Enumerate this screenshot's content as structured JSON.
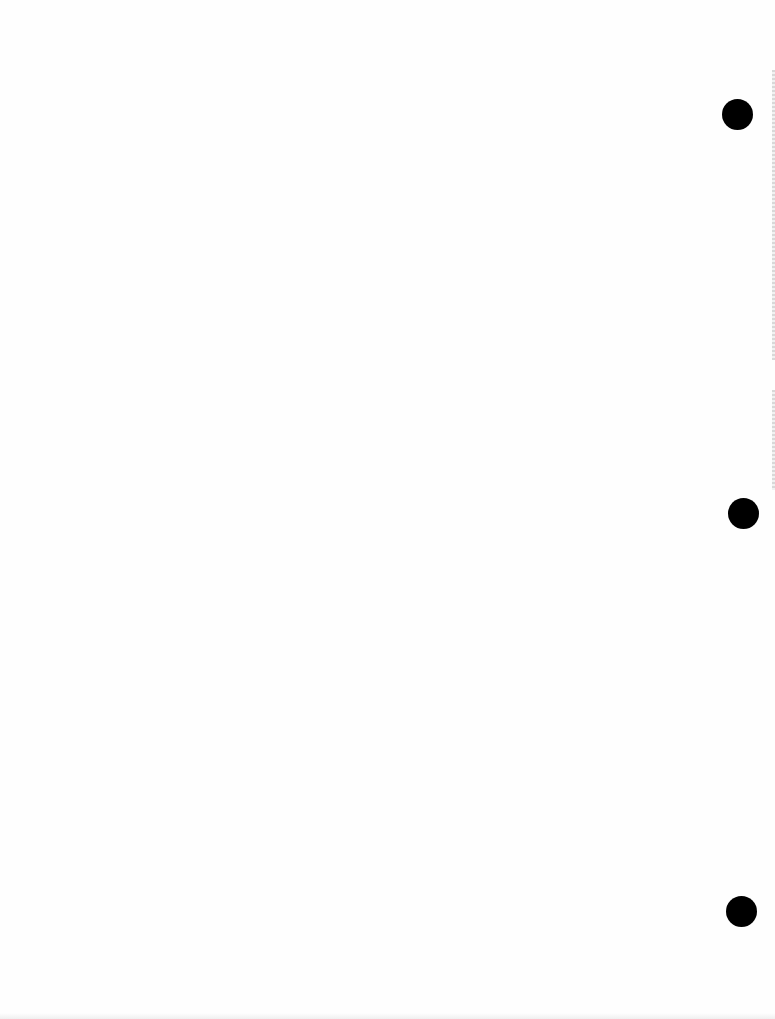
{
  "document": {
    "type": "blank scanned page",
    "background_color": "#fefefe",
    "punch_holes": [
      {
        "name": "top",
        "cx": 737,
        "cy": 114,
        "diameter": 31,
        "color": "#000000"
      },
      {
        "name": "middle",
        "cx": 743,
        "cy": 513,
        "diameter": 31,
        "color": "#000000"
      },
      {
        "name": "bottom",
        "cx": 741,
        "cy": 911,
        "diameter": 31,
        "color": "#000000"
      }
    ],
    "edge_speckle_segments": [
      {
        "top": 70,
        "height": 290
      },
      {
        "top": 390,
        "height": 100
      }
    ]
  }
}
